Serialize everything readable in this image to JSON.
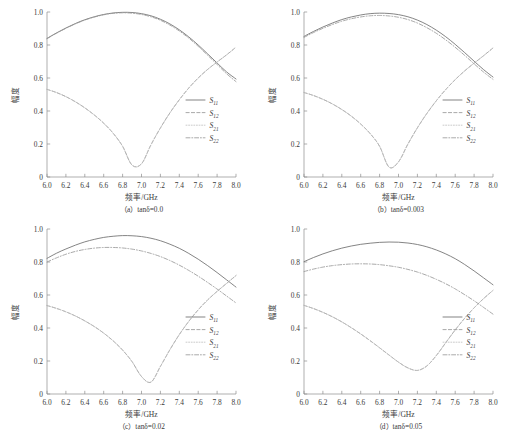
{
  "figure": {
    "width": 515,
    "height": 434,
    "background": "#ffffff",
    "curve_color": "#6e6e6e",
    "axis_color": "#8d8d8d"
  },
  "axes": {
    "xlabel": "频率/GHz",
    "ylabel": "幅度",
    "xticks": [
      "6.0",
      "6.2",
      "6.4",
      "6.6",
      "6.8",
      "7.0",
      "7.2",
      "7.4",
      "7.6",
      "7.8",
      "8.0"
    ],
    "yticks": [
      "0",
      "0.2",
      "0.4",
      "0.6",
      "0.8",
      "1.0"
    ],
    "xlim": [
      6.0,
      8.0
    ],
    "ylim": [
      0,
      1.0
    ],
    "grid": false
  },
  "legend": {
    "position": "lower-right",
    "entries": [
      {
        "base": "S",
        "sub": "11",
        "style": "solid"
      },
      {
        "base": "S",
        "sub": "12",
        "style": "dashed"
      },
      {
        "base": "S",
        "sub": "21",
        "style": "dotted"
      },
      {
        "base": "S",
        "sub": "22",
        "style": "dashdot"
      }
    ]
  },
  "panels": [
    {
      "id": "a",
      "caption": "（a）tanδ=0.0"
    },
    {
      "id": "b",
      "caption": "（b）tanδ=0.003"
    },
    {
      "id": "c",
      "caption": "（c）tanδ=0.02"
    },
    {
      "id": "d",
      "caption": "（d）tanδ=0.05"
    }
  ],
  "chart_data": [
    {
      "type": "line",
      "panel": "a",
      "title": "（a）tanδ=0.0",
      "xlabel": "频率/GHz",
      "ylabel": "幅度",
      "xlim": [
        6.0,
        8.0
      ],
      "ylim": [
        0,
        1.0
      ],
      "grid": false,
      "x": [
        6.0,
        6.1,
        6.2,
        6.3,
        6.4,
        6.5,
        6.6,
        6.7,
        6.8,
        6.9,
        7.0,
        7.1,
        7.2,
        7.3,
        7.4,
        7.5,
        7.6,
        7.7,
        7.8,
        7.9,
        8.0
      ],
      "series": [
        {
          "name": "S11",
          "style": "solid",
          "values": [
            0.84,
            0.873,
            0.903,
            0.93,
            0.953,
            0.971,
            0.985,
            0.994,
            0.998,
            0.997,
            0.99,
            0.977,
            0.956,
            0.928,
            0.892,
            0.849,
            0.8,
            0.746,
            0.691,
            0.637,
            0.594
          ]
        },
        {
          "name": "S12",
          "style": "dashed",
          "values": [
            0.531,
            0.512,
            0.487,
            0.456,
            0.419,
            0.376,
            0.326,
            0.265,
            0.186,
            0.072,
            0.08,
            0.195,
            0.297,
            0.388,
            0.468,
            0.539,
            0.6,
            0.652,
            0.697,
            0.74,
            0.787
          ]
        },
        {
          "name": "S21",
          "style": "dotted",
          "values": [
            0.531,
            0.512,
            0.487,
            0.456,
            0.419,
            0.376,
            0.326,
            0.265,
            0.186,
            0.072,
            0.08,
            0.195,
            0.297,
            0.388,
            0.468,
            0.539,
            0.6,
            0.652,
            0.697,
            0.74,
            0.787
          ]
        },
        {
          "name": "S22",
          "style": "dashdot",
          "values": [
            0.838,
            0.871,
            0.901,
            0.928,
            0.951,
            0.969,
            0.983,
            0.992,
            0.995,
            0.993,
            0.985,
            0.971,
            0.95,
            0.921,
            0.885,
            0.842,
            0.792,
            0.738,
            0.682,
            0.626,
            0.578
          ]
        }
      ]
    },
    {
      "type": "line",
      "panel": "b",
      "title": "（b）tanδ=0.003",
      "xlabel": "频率/GHz",
      "ylabel": "幅度",
      "xlim": [
        6.0,
        8.0
      ],
      "ylim": [
        0,
        1.0
      ],
      "grid": false,
      "x": [
        6.0,
        6.1,
        6.2,
        6.3,
        6.4,
        6.5,
        6.6,
        6.7,
        6.8,
        6.9,
        7.0,
        7.1,
        7.2,
        7.3,
        7.4,
        7.5,
        7.6,
        7.7,
        7.8,
        7.9,
        8.0
      ],
      "series": [
        {
          "name": "S11",
          "style": "solid",
          "values": [
            0.852,
            0.882,
            0.909,
            0.933,
            0.954,
            0.97,
            0.982,
            0.99,
            0.993,
            0.991,
            0.984,
            0.971,
            0.951,
            0.924,
            0.89,
            0.85,
            0.804,
            0.754,
            0.702,
            0.651,
            0.606
          ]
        },
        {
          "name": "S12",
          "style": "dashed",
          "values": [
            0.512,
            0.494,
            0.471,
            0.443,
            0.409,
            0.369,
            0.321,
            0.263,
            0.186,
            0.06,
            0.092,
            0.2,
            0.298,
            0.385,
            0.462,
            0.53,
            0.59,
            0.643,
            0.69,
            0.735,
            0.782
          ]
        },
        {
          "name": "S21",
          "style": "dotted",
          "values": [
            0.512,
            0.494,
            0.471,
            0.443,
            0.409,
            0.369,
            0.321,
            0.263,
            0.186,
            0.06,
            0.092,
            0.2,
            0.298,
            0.385,
            0.462,
            0.53,
            0.59,
            0.643,
            0.69,
            0.735,
            0.782
          ]
        },
        {
          "name": "S22",
          "style": "dashdot",
          "values": [
            0.846,
            0.875,
            0.901,
            0.924,
            0.944,
            0.959,
            0.97,
            0.977,
            0.979,
            0.976,
            0.968,
            0.954,
            0.933,
            0.905,
            0.871,
            0.831,
            0.786,
            0.737,
            0.686,
            0.636,
            0.592
          ]
        }
      ]
    },
    {
      "type": "line",
      "panel": "c",
      "title": "（c）tanδ=0.02",
      "xlabel": "频率/GHz",
      "ylabel": "幅度",
      "xlim": [
        6.0,
        8.0
      ],
      "ylim": [
        0,
        1.0
      ],
      "grid": false,
      "x": [
        6.0,
        6.1,
        6.2,
        6.3,
        6.4,
        6.5,
        6.6,
        6.7,
        6.8,
        6.9,
        7.0,
        7.1,
        7.2,
        7.3,
        7.4,
        7.5,
        7.6,
        7.7,
        7.8,
        7.9,
        8.0
      ],
      "series": [
        {
          "name": "S11",
          "style": "solid",
          "values": [
            0.822,
            0.853,
            0.879,
            0.902,
            0.922,
            0.937,
            0.949,
            0.956,
            0.96,
            0.959,
            0.954,
            0.944,
            0.929,
            0.908,
            0.883,
            0.852,
            0.817,
            0.778,
            0.736,
            0.692,
            0.648
          ]
        },
        {
          "name": "S12",
          "style": "dashed",
          "values": [
            0.536,
            0.519,
            0.498,
            0.473,
            0.443,
            0.409,
            0.369,
            0.322,
            0.266,
            0.196,
            0.106,
            0.072,
            0.167,
            0.268,
            0.36,
            0.44,
            0.51,
            0.57,
            0.622,
            0.67,
            0.718
          ]
        },
        {
          "name": "S21",
          "style": "dotted",
          "values": [
            0.536,
            0.519,
            0.498,
            0.473,
            0.443,
            0.409,
            0.369,
            0.322,
            0.266,
            0.196,
            0.106,
            0.072,
            0.167,
            0.268,
            0.36,
            0.44,
            0.51,
            0.57,
            0.622,
            0.67,
            0.718
          ]
        },
        {
          "name": "S22",
          "style": "dashdot",
          "values": [
            0.8,
            0.825,
            0.847,
            0.864,
            0.876,
            0.884,
            0.888,
            0.888,
            0.885,
            0.878,
            0.867,
            0.852,
            0.833,
            0.809,
            0.781,
            0.749,
            0.714,
            0.676,
            0.636,
            0.594,
            0.552
          ]
        }
      ]
    },
    {
      "type": "line",
      "panel": "d",
      "title": "（d）tanδ=0.05",
      "xlabel": "频率/GHz",
      "ylabel": "幅度",
      "xlim": [
        6.0,
        8.0
      ],
      "ylim": [
        0,
        1.0
      ],
      "grid": false,
      "x": [
        6.0,
        6.1,
        6.2,
        6.3,
        6.4,
        6.5,
        6.6,
        6.7,
        6.8,
        6.9,
        7.0,
        7.1,
        7.2,
        7.3,
        7.4,
        7.5,
        7.6,
        7.7,
        7.8,
        7.9,
        8.0
      ],
      "series": [
        {
          "name": "S11",
          "style": "solid",
          "values": [
            0.802,
            0.827,
            0.849,
            0.868,
            0.884,
            0.897,
            0.907,
            0.914,
            0.919,
            0.921,
            0.92,
            0.915,
            0.906,
            0.892,
            0.873,
            0.849,
            0.82,
            0.785,
            0.746,
            0.704,
            0.662
          ]
        },
        {
          "name": "S12",
          "style": "dashed",
          "values": [
            0.537,
            0.518,
            0.495,
            0.468,
            0.437,
            0.402,
            0.364,
            0.323,
            0.28,
            0.236,
            0.193,
            0.158,
            0.143,
            0.17,
            0.233,
            0.311,
            0.388,
            0.459,
            0.522,
            0.578,
            0.628
          ]
        },
        {
          "name": "S21",
          "style": "dotted",
          "values": [
            0.537,
            0.518,
            0.495,
            0.468,
            0.437,
            0.402,
            0.364,
            0.323,
            0.28,
            0.236,
            0.193,
            0.158,
            0.143,
            0.17,
            0.233,
            0.311,
            0.388,
            0.459,
            0.522,
            0.578,
            0.628
          ]
        },
        {
          "name": "S22",
          "style": "dashdot",
          "values": [
            0.742,
            0.757,
            0.769,
            0.778,
            0.784,
            0.788,
            0.789,
            0.788,
            0.784,
            0.777,
            0.768,
            0.755,
            0.739,
            0.719,
            0.695,
            0.668,
            0.637,
            0.602,
            0.565,
            0.525,
            0.484
          ]
        }
      ]
    }
  ]
}
